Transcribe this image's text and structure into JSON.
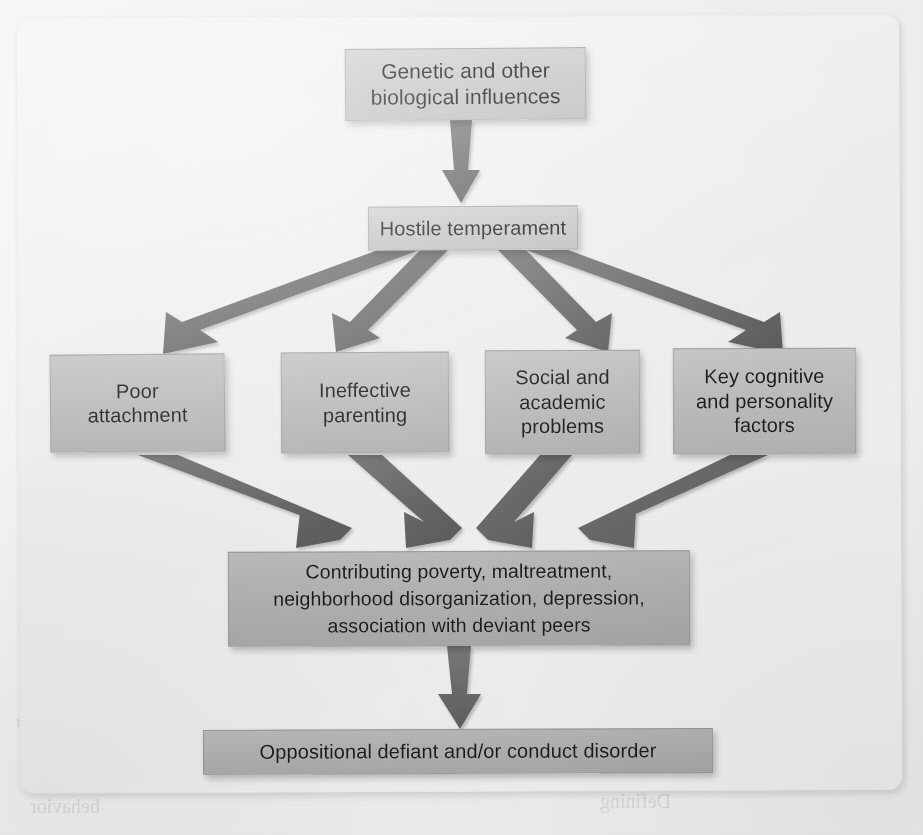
{
  "figure": {
    "type": "flowchart",
    "direction": "top-to-bottom",
    "nodes": [
      {
        "id": "genetic",
        "label": "Genetic and other\nbiological influences",
        "lines": [
          "Genetic and other",
          "biological influences"
        ],
        "level": 1
      },
      {
        "id": "hostile",
        "label": "Hostile temperament",
        "lines": [
          "Hostile temperament"
        ],
        "level": 2
      },
      {
        "id": "poor",
        "label": "Poor attachment",
        "lines": [
          "Poor",
          "attachment"
        ],
        "level": 3
      },
      {
        "id": "ineffective",
        "label": "Ineffective parenting",
        "lines": [
          "Ineffective",
          "parenting"
        ],
        "level": 3
      },
      {
        "id": "social",
        "label": "Social and academic problems",
        "lines": [
          "Social and",
          "academic",
          "problems"
        ],
        "level": 3
      },
      {
        "id": "key",
        "label": "Key cognitive and personality factors",
        "lines": [
          "Key cognitive",
          "and personality",
          "factors"
        ],
        "level": 3
      },
      {
        "id": "contributing",
        "label": "Contributing poverty, maltreatment, neighborhood disorganization, depression, association with deviant peers",
        "lines": [
          "Contributing poverty, maltreatment,",
          "neighborhood disorganization, depression,",
          "association with deviant peers"
        ],
        "level": 4
      },
      {
        "id": "oppositional",
        "label": "Oppositional defiant and/or conduct disorder",
        "lines": [
          "Oppositional defiant and/or conduct disorder"
        ],
        "level": 5
      }
    ],
    "edges": [
      {
        "from": "genetic",
        "to": "hostile",
        "style": "straight-down"
      },
      {
        "from": "hostile",
        "to": "poor",
        "style": "diverging"
      },
      {
        "from": "hostile",
        "to": "ineffective",
        "style": "diverging"
      },
      {
        "from": "hostile",
        "to": "social",
        "style": "diverging"
      },
      {
        "from": "hostile",
        "to": "key",
        "style": "diverging"
      },
      {
        "from": "poor",
        "to": "contributing",
        "style": "converging"
      },
      {
        "from": "ineffective",
        "to": "contributing",
        "style": "converging"
      },
      {
        "from": "social",
        "to": "contributing",
        "style": "converging"
      },
      {
        "from": "key",
        "to": "contributing",
        "style": "converging"
      },
      {
        "from": "contributing",
        "to": "oppositional",
        "style": "straight-down"
      }
    ],
    "colors": {
      "arrow": "#6f6f6f",
      "arrow_dark": "#5e5e5e",
      "box_light": "#d0d0d0",
      "box_mid": "#c0c0c0",
      "box_dark": "#b2b2b2",
      "panel": "#eeeeee",
      "page": "#f1f1f1",
      "text": "#1b1b1b"
    }
  },
  "bleed_through": {
    "note": "faint mirrored text showing through the scanned page",
    "items": [
      {
        "text": "Genetic and other",
        "x": 660,
        "y": 58,
        "size": 21
      },
      {
        "text": "biological influences",
        "x": 640,
        "y": 84,
        "size": 21
      },
      {
        "text": "Hostile",
        "x": 150,
        "y": 90,
        "size": 18
      },
      {
        "text": "Oppositional defiant and/or conduct disorder",
        "x": 60,
        "y": 710,
        "size": 18
      },
      {
        "text": "FIGURE 13.2  Similar developmental pathway to attention deficit/hyperactivity disorder",
        "x": 15,
        "y": 712,
        "size": 17
      },
      {
        "text": "behavior",
        "x": 30,
        "y": 795,
        "size": 20
      },
      {
        "text": "Defining",
        "x": 600,
        "y": 790,
        "size": 20
      },
      {
        "text": "parents",
        "x": 660,
        "y": 770,
        "size": 17
      }
    ]
  }
}
